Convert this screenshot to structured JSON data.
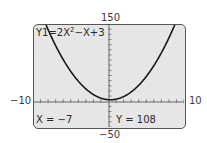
{
  "chart_data": {
    "type": "line",
    "title": "",
    "equation": "Y1=2X²−X+3",
    "equation_parts": {
      "prefix": "Y1=2X",
      "exp": "2",
      "suffix": "−X+3"
    },
    "xlim": [
      -10,
      10
    ],
    "ylim": [
      -50,
      150
    ],
    "xscale": 1,
    "yscale": 10,
    "x_tick_labels": {
      "min": "−10",
      "max": "10"
    },
    "y_tick_labels": {
      "min": "−50",
      "max": "150"
    },
    "series": [
      {
        "name": "Y1",
        "function": "2x^2 - x + 3",
        "x": [
          -8,
          -7,
          -6,
          -5,
          -4,
          -3,
          -2,
          -1,
          0,
          1,
          2,
          3,
          4,
          5,
          6,
          7,
          8,
          9
        ],
        "y": [
          139,
          108,
          81,
          58,
          39,
          24,
          13,
          6,
          3,
          4,
          9,
          18,
          31,
          48,
          69,
          94,
          123,
          156
        ]
      }
    ],
    "trace": {
      "x": -7,
      "y": 108
    },
    "grid": false,
    "legend": "none"
  },
  "screen": {
    "equation_label": "Y1=2X",
    "equation_exp": "2",
    "equation_tail": "−X+3",
    "trace_x": "X = −7",
    "trace_y": "Y = 108"
  },
  "axes": {
    "ymax_label": "150",
    "ymin_label": "−50",
    "xmin_label": "−10",
    "xmax_label": "10"
  },
  "colors": {
    "screen_bg": "#e6e6e6",
    "curve": "#1a1a1a",
    "axis": "#555555"
  }
}
